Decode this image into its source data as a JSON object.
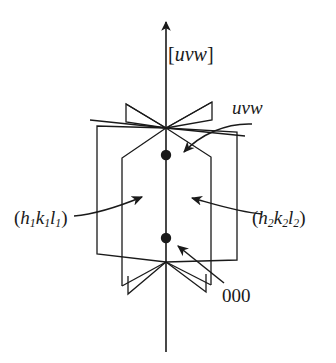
{
  "figure": {
    "type": "crystallography-zone-axis-diagram",
    "background_color": "#ffffff",
    "stroke_color": "#1a1a1a",
    "labels": {
      "zone_axis_bracket_open": "[",
      "zone_axis": "uvw",
      "zone_axis_bracket_close": "]",
      "lattice_point_uvw": "uvw",
      "plane_left_open": "(",
      "plane_left_h": "h",
      "plane_left_h_sub": "1",
      "plane_left_k": "k",
      "plane_left_k_sub": "1",
      "plane_left_l": "l",
      "plane_left_l_sub": "1",
      "plane_left_close": ")",
      "plane_right_open": "(",
      "plane_right_h": "h",
      "plane_right_h_sub": "2",
      "plane_right_k": "k",
      "plane_right_k_sub": "2",
      "plane_right_l": "l",
      "plane_right_l_sub": "2",
      "plane_right_close": ")",
      "origin": "000"
    },
    "geometry": {
      "axis_x": 166,
      "axis_top_y": 20,
      "axis_bottom_y": 352,
      "convergence_point": [
        166,
        128
      ],
      "lattice_point_upper": [
        166,
        155
      ],
      "lattice_point_lower": [
        166,
        238
      ],
      "dot_radius": 5
    }
  }
}
